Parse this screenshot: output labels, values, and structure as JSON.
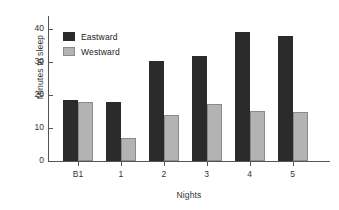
{
  "chart_data": {
    "type": "bar",
    "title": "",
    "xlabel": "Nights",
    "ylabel": "Minutes to sleep",
    "categories": [
      "B1",
      "1",
      "2",
      "3",
      "4",
      "5"
    ],
    "series": [
      {
        "name": "Eastward",
        "color": "#2b2b2b",
        "values": [
          18.5,
          18,
          30.5,
          32,
          39,
          38
        ]
      },
      {
        "name": "Westward",
        "color": "#b3b3b3",
        "values": [
          18,
          7,
          14,
          17.3,
          15.3,
          15
        ]
      }
    ],
    "ylim": [
      0,
      44
    ],
    "yticks": [
      0,
      10,
      20,
      30,
      40
    ],
    "ytick_labels": [
      "0",
      "10",
      "20",
      "30",
      "40"
    ],
    "grid": false,
    "legend_position": "upper-left-inside"
  },
  "legend": {
    "items": [
      {
        "label": "Eastward",
        "swatch": "dark-square-swatch"
      },
      {
        "label": "Westward",
        "swatch": "light-square-swatch"
      }
    ]
  },
  "axes": {
    "y_label": "Minutes to sleep",
    "x_label": "Nights"
  }
}
